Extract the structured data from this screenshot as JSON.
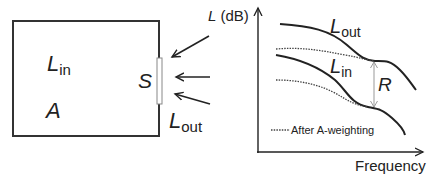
{
  "room": {
    "inside_level": {
      "main": "L",
      "sub": "in"
    },
    "absorption": "A",
    "surface": "S",
    "outside_level": {
      "main": "L",
      "sub": "out"
    }
  },
  "graph": {
    "y_axis_label": {
      "main": "L",
      "rest": " (dB)"
    },
    "x_axis_label": "Frequency",
    "curve_outside": {
      "main": "L",
      "sub": "out"
    },
    "curve_inside": {
      "main": "L",
      "sub": "in"
    },
    "difference_label": "R",
    "legend": "After A-weighting"
  },
  "colors": {
    "line": "#222222",
    "window_fill": "#ffffff",
    "window_stroke": "#888888",
    "dashed": "#444444",
    "arrow_r": "#999999"
  }
}
